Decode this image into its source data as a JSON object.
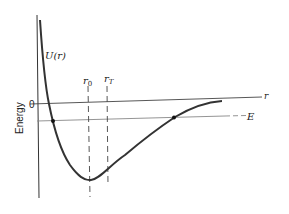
{
  "diagram": {
    "y_axis_label": "Energy",
    "x_axis_label": "r",
    "zero_label": "0",
    "curve_label": "U(r)",
    "energy_level_label": "E",
    "marker_r0": {
      "base": "r",
      "sub": "0"
    },
    "marker_rT": {
      "base": "r",
      "sub": "T"
    },
    "colors": {
      "curve": "#333333",
      "axis": "#333333",
      "energy_line": "#777777",
      "dashed": "#444444"
    }
  }
}
